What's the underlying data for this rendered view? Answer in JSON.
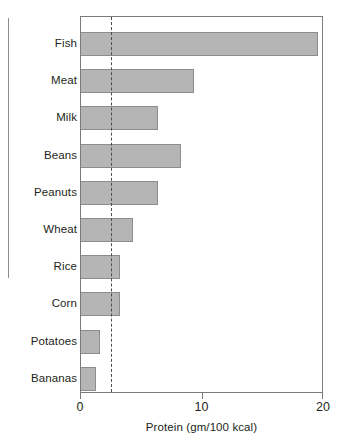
{
  "chart_data": {
    "type": "bar",
    "orientation": "horizontal",
    "title": "",
    "xlabel": "Protein (gm/100 kcal)",
    "ylabel": "",
    "xlim": [
      0,
      20
    ],
    "xticks": [
      0,
      10,
      20
    ],
    "xtick_labels": [
      "0",
      "10",
      "20"
    ],
    "grid": false,
    "legend": null,
    "categories": [
      "Fish",
      "Meat",
      "Milk",
      "Beans",
      "Peanuts",
      "Wheat",
      "Rice",
      "Corn",
      "Potatoes",
      "Bananas"
    ],
    "values": [
      19.5,
      9.3,
      6.3,
      8.2,
      6.3,
      4.3,
      3.2,
      3.2,
      1.6,
      1.2
    ],
    "bars": [
      {
        "label": "Fish",
        "value": 19.5
      },
      {
        "label": "Meat",
        "value": 9.3
      },
      {
        "label": "Milk",
        "value": 6.3
      },
      {
        "label": "Beans",
        "value": 8.2
      },
      {
        "label": "Peanuts",
        "value": 6.3
      },
      {
        "label": "Wheat",
        "value": 4.3
      },
      {
        "label": "Rice",
        "value": 3.2
      },
      {
        "label": "Corn",
        "value": 3.2
      },
      {
        "label": "Potatoes",
        "value": 1.6
      },
      {
        "label": "Bananas",
        "value": 1.2
      }
    ],
    "annotations": [
      {
        "name": "reference-line",
        "style": "dashed-vertical",
        "value": 2.5,
        "label": ""
      },
      {
        "name": "group-bracket",
        "style": "vertical-line",
        "spans_categories": [
          "Fish",
          "Meat",
          "Milk",
          "Beans",
          "Peanuts",
          "Wheat",
          "Rice"
        ],
        "label": ""
      }
    ],
    "colors": {
      "bar_fill": "#b5b5b5",
      "bar_stroke": "#8d8d8d",
      "axis": "#7b7b7b",
      "reference_line": "#4d4d4d",
      "text": "#231f20",
      "background": "#ffffff"
    }
  }
}
